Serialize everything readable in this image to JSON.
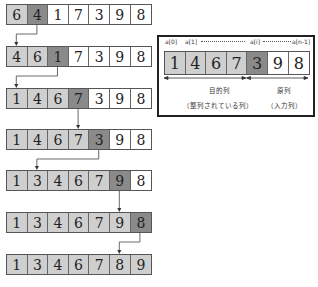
{
  "steps": [
    {
      "cells": [
        6,
        4,
        1,
        7,
        3,
        9,
        8
      ],
      "states": [
        "sorted",
        "key",
        "unsorted",
        "unsorted",
        "unsorted",
        "unsorted",
        "unsorted"
      ]
    },
    {
      "cells": [
        4,
        6,
        1,
        7,
        3,
        9,
        8
      ],
      "states": [
        "sorted",
        "sorted",
        "key",
        "unsorted",
        "unsorted",
        "unsorted",
        "unsorted"
      ]
    },
    {
      "cells": [
        1,
        4,
        6,
        7,
        3,
        9,
        8
      ],
      "states": [
        "sorted",
        "sorted",
        "sorted",
        "key",
        "unsorted",
        "unsorted",
        "unsorted"
      ]
    },
    {
      "cells": [
        1,
        4,
        6,
        7,
        3,
        9,
        8
      ],
      "states": [
        "sorted",
        "sorted",
        "sorted",
        "sorted",
        "key",
        "unsorted",
        "unsorted"
      ]
    },
    {
      "cells": [
        1,
        3,
        4,
        6,
        7,
        9,
        8
      ],
      "states": [
        "sorted",
        "sorted",
        "sorted",
        "sorted",
        "sorted",
        "key",
        "unsorted"
      ]
    },
    {
      "cells": [
        1,
        3,
        4,
        6,
        7,
        9,
        8
      ],
      "states": [
        "sorted",
        "sorted",
        "sorted",
        "sorted",
        "sorted",
        "sorted",
        "key"
      ]
    },
    {
      "cells": [
        1,
        3,
        4,
        6,
        7,
        8,
        9
      ],
      "states": [
        "sorted",
        "sorted",
        "sorted",
        "sorted",
        "sorted",
        "sorted",
        "sorted"
      ]
    }
  ],
  "insertions": [
    {
      "from_step": 0,
      "from_index": 1,
      "to_index": 0
    },
    {
      "from_step": 1,
      "from_index": 2,
      "to_index": 0
    },
    {
      "from_step": 2,
      "from_index": 3,
      "to_index": 3
    },
    {
      "from_step": 3,
      "from_index": 4,
      "to_index": 1
    },
    {
      "from_step": 4,
      "from_index": 5,
      "to_index": 5
    },
    {
      "from_step": 5,
      "from_index": 6,
      "to_index": 5
    }
  ],
  "legend": {
    "index_labels": {
      "first": "a[0]",
      "second": "a[1]",
      "current": "a[i]",
      "last": "a[n-1]"
    },
    "cells": [
      1,
      4,
      6,
      7,
      3,
      9,
      8
    ],
    "states": [
      "sorted",
      "sorted",
      "sorted",
      "sorted",
      "key",
      "unsorted",
      "unsorted"
    ],
    "target_label": "目的列",
    "target_sublabel": "（整列されている列）",
    "source_label": "原列",
    "source_sublabel": "（入力列）"
  },
  "colors": {
    "sorted": "#cfcfcf",
    "key": "#8a8a8a",
    "unsorted": "#ffffff"
  }
}
